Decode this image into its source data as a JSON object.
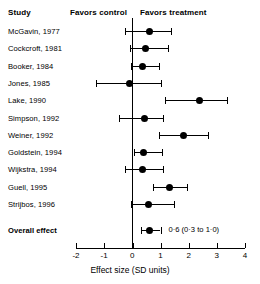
{
  "header": {
    "study_col": "Study",
    "favors_control": "Favors control",
    "favors_treatment": "Favors treatment"
  },
  "axis": {
    "xlabel": "Effect size (SD units)",
    "ticks": [
      "-2",
      "-1",
      "0",
      "1",
      "2",
      "3",
      "4"
    ],
    "tick_values": [
      -2,
      -1,
      0,
      1,
      2,
      3,
      4
    ],
    "xmin": -2,
    "xmax": 4,
    "null_line": 0
  },
  "overall": {
    "label": "Overall effect",
    "ci_text": "0·6 (0·3 to 1·0)"
  },
  "colors": {
    "marker": "#000000",
    "line": "#000000",
    "background": "#ffffff"
  },
  "chart_data": {
    "type": "scatter",
    "title": "",
    "subtitle": "",
    "xlabel": "Effect size (SD units)",
    "ylabel": "Study",
    "xlim": [
      -2,
      4
    ],
    "grid": false,
    "legend": null,
    "null_line": 0,
    "annotations": [
      "Favors control",
      "Favors treatment",
      "0·6 (0·3 to 1·0)"
    ],
    "rows": [
      {
        "label": "McGavin, 1977",
        "estimate": 0.6,
        "ci_low": -0.25,
        "ci_high": 1.38
      },
      {
        "label": "Cockcroft, 1981",
        "estimate": 0.46,
        "ci_low": -0.1,
        "ci_high": 1.28
      },
      {
        "label": "Booker, 1984",
        "estimate": 0.35,
        "ci_low": -0.04,
        "ci_high": 0.96
      },
      {
        "label": "Jones, 1985",
        "estimate": -0.1,
        "ci_low": -1.28,
        "ci_high": 1.03
      },
      {
        "label": "Lake, 1990",
        "estimate": 2.38,
        "ci_low": 1.17,
        "ci_high": 3.37
      },
      {
        "label": "Simpson, 1992",
        "estimate": 0.43,
        "ci_low": -0.46,
        "ci_high": 1.1
      },
      {
        "label": "Weiner, 1992",
        "estimate": 1.8,
        "ci_low": 0.93,
        "ci_high": 2.7
      },
      {
        "label": "Goldstein, 1994",
        "estimate": 0.39,
        "ci_low": 0.07,
        "ci_high": 1.06
      },
      {
        "label": "Wijkstra, 1994",
        "estimate": 0.35,
        "ci_low": -0.25,
        "ci_high": 1.1
      },
      {
        "label": "Guell, 1995",
        "estimate": 1.31,
        "ci_low": 0.74,
        "ci_high": 1.95
      },
      {
        "label": "Strijbos, 1996",
        "estimate": 0.57,
        "ci_low": -0.04,
        "ci_high": 1.49
      }
    ],
    "summary": {
      "label": "Overall effect",
      "estimate": 0.6,
      "ci_low": 0.3,
      "ci_high": 1.0,
      "ci_text": "0·6 (0·3 to 1·0)"
    }
  }
}
